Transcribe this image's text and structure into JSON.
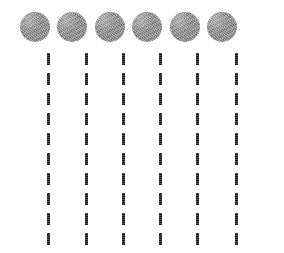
{
  "figure": {
    "width": 284,
    "height": 253,
    "background_color": "#fefefe"
  },
  "dots": {
    "count": 6,
    "diameter": 30,
    "top": 12,
    "color": "#8d8d8d",
    "texture": "noisy-grain",
    "shape": "circle",
    "centers_x": [
      35,
      72,
      110,
      147,
      185,
      222
    ]
  },
  "dashed_lines": {
    "count": 6,
    "color": "#3a3a3a",
    "line_width": 3,
    "dash_length": 12,
    "gap_length": 8,
    "period": 20,
    "start_y": 53,
    "end_y": 253,
    "dashes_per_column": 10,
    "columns_x": [
      47,
      85,
      122,
      159,
      196,
      235
    ],
    "orientation": "vertical"
  }
}
